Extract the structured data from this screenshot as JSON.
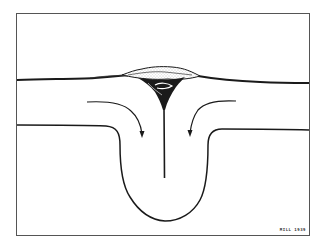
{
  "diagram": {
    "type": "cross-section sketch",
    "elements": {
      "frame": "rectangular border",
      "surface_line": "thick horizontal upper boundary",
      "surface_accumulation": "stippled lens-shaped mass above the convergence point",
      "central_plume": "dark tapering vertical line descending from the accumulation",
      "lower_boundary": "horizontal line bending down into a U-shaped trough",
      "flow_arrows": [
        "left arrow curving down toward center",
        "right arrow curving down toward center"
      ]
    },
    "signature": "MILL 1939"
  },
  "colors": {
    "ink": "#1a1a1a",
    "frame": "#555555",
    "background": "#ffffff",
    "stipple": "#999999"
  }
}
